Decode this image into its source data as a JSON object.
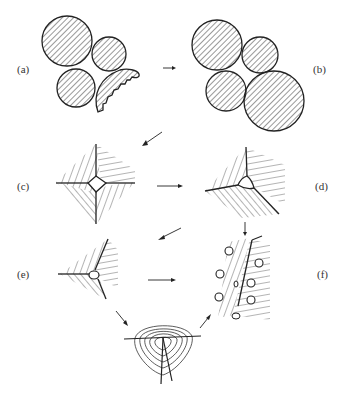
{
  "figure": {
    "panels": [
      {
        "id": "a",
        "label": "(a)",
        "content": "loose particles with irregular particle"
      },
      {
        "id": "b",
        "label": "(b)",
        "content": "four spherical particles in contact"
      },
      {
        "id": "c",
        "label": "(c)",
        "content": "four grains with square pore at junction"
      },
      {
        "id": "d",
        "label": "(d)",
        "content": "three grains with triangular pore at junction"
      },
      {
        "id": "e",
        "label": "(e)",
        "content": "three grains with small rounded pore"
      },
      {
        "id": "f",
        "label": "(f)",
        "content": "grain boundary with isolated spherical pores"
      },
      {
        "id": "g",
        "label": "",
        "content": "vacancy diffusion contours around pore at triple junction"
      }
    ],
    "colors": {
      "ink": "#222222",
      "background": "#ffffff"
    }
  }
}
